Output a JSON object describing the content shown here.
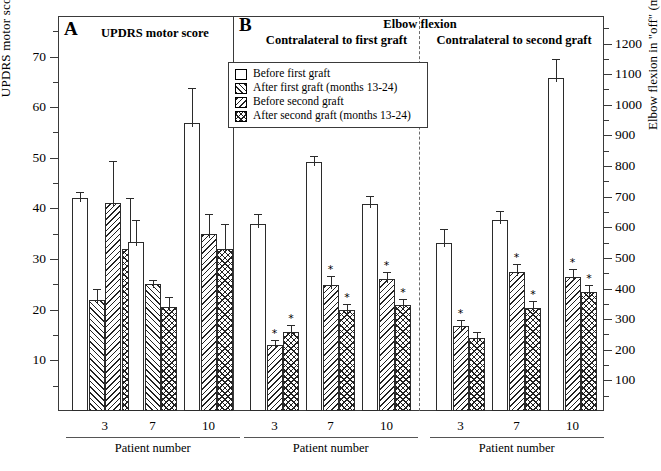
{
  "axes": {
    "left": {
      "title": "UPDRS motor score in \"off\"",
      "ticks": [
        10,
        20,
        30,
        40,
        50,
        60,
        70
      ],
      "min": 0,
      "max": 78,
      "minor_step": 5
    },
    "right": {
      "title": "Elbow flexion in \"off\" (ms)",
      "ticks": [
        100,
        200,
        300,
        400,
        500,
        600,
        700,
        800,
        900,
        1000,
        1100,
        1200
      ],
      "min": 0,
      "max": 1290,
      "minor_step": 50
    },
    "x_group_caption": "Patient number"
  },
  "panels": [
    {
      "letter": "A",
      "title": "UPDRS motor score",
      "subtitle": ""
    },
    {
      "letter": "B",
      "title": "Elbow flexion",
      "sub_left": "Contralateral to first graft",
      "sub_right": "Contralateral to second graft"
    }
  ],
  "legend": {
    "items": [
      {
        "label": "Before first graft",
        "pattern": "plain"
      },
      {
        "label": "After first graft (months 13-24)",
        "pattern": "hatch-right"
      },
      {
        "label": "Before second graft",
        "pattern": "hatch-left"
      },
      {
        "label": "After second graft (months 13-24)",
        "pattern": "crosshatch"
      }
    ]
  },
  "chart_data": {
    "type": "bar",
    "xlabel": "Patient number",
    "groups": [
      {
        "panel": "A",
        "name": "UPDRS motor score",
        "ylabel": "UPDRS motor score in \"off\"",
        "ylim": [
          0,
          78
        ],
        "patients": [
          {
            "patient": "3",
            "bars": [
              {
                "series": "Before first graft",
                "value": 42.0,
                "err": 1.2,
                "sig": false
              },
              {
                "series": "After first graft (months 13-24)",
                "value": 22.0,
                "err": 2.0,
                "sig": false
              },
              {
                "series": "Before second graft",
                "value": 41.0,
                "err": 8.3,
                "sig": false
              },
              {
                "series": "After second graft (months 13-24)",
                "value": 32.0,
                "err": 10.0,
                "sig": false
              }
            ]
          },
          {
            "patient": "7",
            "bars": [
              {
                "series": "Before first graft",
                "value": 33.3,
                "err": 4.5,
                "sig": false
              },
              {
                "series": "After first graft (months 13-24)",
                "value": 25.0,
                "err": 0.8,
                "sig": false
              },
              {
                "series": "After second graft (months 13-24)",
                "value": 20.5,
                "err": 2.0,
                "sig": false
              }
            ]
          },
          {
            "patient": "10",
            "bars": [
              {
                "series": "Before first graft",
                "value": 56.8,
                "err": 7.0,
                "sig": false
              },
              {
                "series": "Before second graft",
                "value": 35.0,
                "err": 4.0,
                "sig": false
              },
              {
                "series": "After second graft (months 13-24)",
                "value": 32.0,
                "err": 5.0,
                "sig": false
              }
            ]
          }
        ]
      },
      {
        "panel": "B-left",
        "name": "Contralateral to first graft",
        "ylabel": "Elbow flexion in \"off\" (ms)",
        "ylim": [
          0,
          1290
        ],
        "patients": [
          {
            "patient": "3",
            "bars": [
              {
                "series": "Before first graft",
                "value": 610,
                "err": 35,
                "sig": false
              },
              {
                "series": "Before second graft",
                "value": 215,
                "err": 18,
                "sig": true
              },
              {
                "series": "After second graft (months 13-24)",
                "value": 258,
                "err": 22,
                "sig": true
              }
            ]
          },
          {
            "patient": "7",
            "bars": [
              {
                "series": "Before first graft",
                "value": 812,
                "err": 22,
                "sig": false
              },
              {
                "series": "Before second graft",
                "value": 413,
                "err": 28,
                "sig": true
              },
              {
                "series": "After second graft (months 13-24)",
                "value": 330,
                "err": 20,
                "sig": true
              }
            ]
          },
          {
            "patient": "10",
            "bars": [
              {
                "series": "Before first graft",
                "value": 675,
                "err": 28,
                "sig": false
              },
              {
                "series": "Before second graft",
                "value": 430,
                "err": 25,
                "sig": true
              },
              {
                "series": "After second graft (months 13-24)",
                "value": 345,
                "err": 20,
                "sig": true
              }
            ]
          }
        ]
      },
      {
        "panel": "B-right",
        "name": "Contralateral to second graft",
        "ylabel": "Elbow flexion in \"off\" (ms)",
        "ylim": [
          0,
          1290
        ],
        "patients": [
          {
            "patient": "3",
            "bars": [
              {
                "series": "Before first graft",
                "value": 548,
                "err": 45,
                "sig": false
              },
              {
                "series": "Before second graft",
                "value": 278,
                "err": 20,
                "sig": true
              },
              {
                "series": "After second graft (months 13-24)",
                "value": 240,
                "err": 18,
                "sig": false
              }
            ]
          },
          {
            "patient": "7",
            "bars": [
              {
                "series": "Before first graft",
                "value": 625,
                "err": 28,
                "sig": false
              },
              {
                "series": "Before second graft",
                "value": 455,
                "err": 25,
                "sig": true
              },
              {
                "series": "After second graft (months 13-24)",
                "value": 338,
                "err": 22,
                "sig": true
              }
            ]
          },
          {
            "patient": "10",
            "bars": [
              {
                "series": "Before first graft",
                "value": 1088,
                "err": 60,
                "sig": false
              },
              {
                "series": "Before second graft",
                "value": 438,
                "err": 25,
                "sig": true
              },
              {
                "series": "After second graft (months 13-24)",
                "value": 388,
                "err": 22,
                "sig": true
              }
            ]
          }
        ]
      }
    ]
  }
}
